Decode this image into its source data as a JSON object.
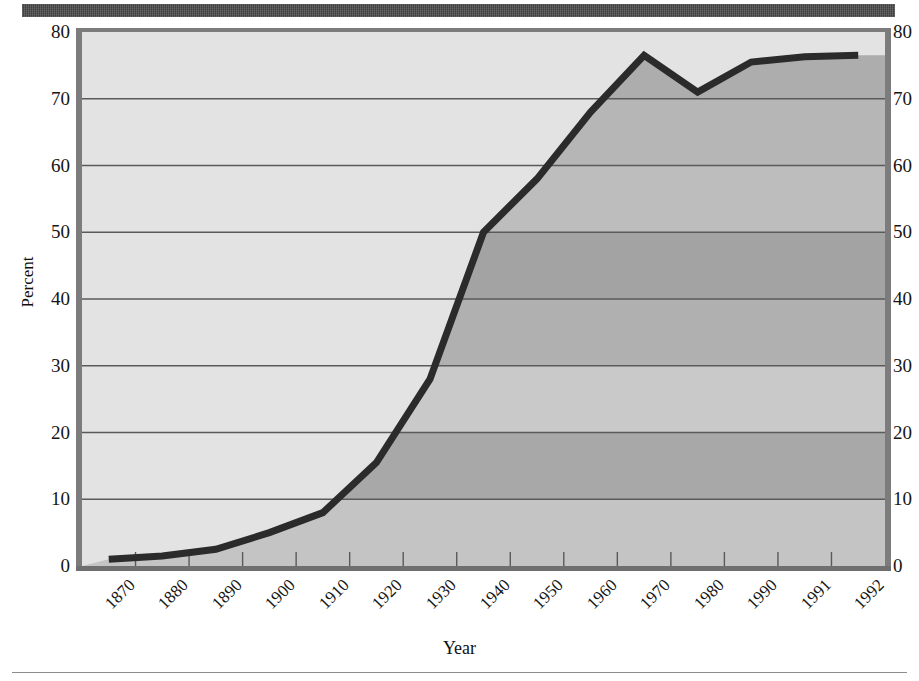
{
  "banner": {
    "title": ""
  },
  "chart_data": {
    "type": "line",
    "title": "",
    "xlabel": "Year",
    "ylabel": "Percent",
    "categories": [
      "1870",
      "1880",
      "1890",
      "1900",
      "1910",
      "1920",
      "1930",
      "1940",
      "1950",
      "1960",
      "1970",
      "1980",
      "1990",
      "1991",
      "1992"
    ],
    "values": [
      1,
      1.5,
      2.5,
      5,
      8,
      15.5,
      28,
      50,
      58,
      68,
      76.5,
      71,
      75.5,
      76.3,
      76.5
    ],
    "series": [
      {
        "name": "Percent",
        "values": [
          1,
          1.5,
          2.5,
          5,
          8,
          15.5,
          28,
          50,
          58,
          68,
          76.5,
          71,
          75.5,
          76.3,
          76.5
        ]
      }
    ],
    "ylim": [
      0,
      80
    ],
    "yticks": [
      0,
      10,
      20,
      30,
      40,
      50,
      60,
      70,
      80
    ],
    "ytick_labels": [
      "0",
      "10",
      "20",
      "30",
      "40",
      "50",
      "60",
      "70",
      "80"
    ],
    "grid": true,
    "grid_axis": "y",
    "legend": "none",
    "line_color": "#2b2b2b",
    "plot_background": "#e3e3e3",
    "fill_bands": [
      "#c4c4c4",
      "#a8a8a8",
      "#c9c9c9",
      "#b0b0b0",
      "#a3a3a3",
      "#bdbdbd",
      "#b6b6b6",
      "#adadad"
    ],
    "right_axis_labels": [
      "0",
      "10",
      "20",
      "30",
      "40",
      "50",
      "60",
      "70",
      "80"
    ]
  }
}
